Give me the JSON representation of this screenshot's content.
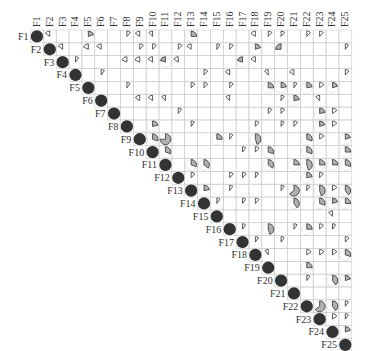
{
  "chart_data": {
    "type": "heatmap",
    "subtype": "correlogram-pie-upper",
    "title": "",
    "variables": [
      "F1",
      "F2",
      "F3",
      "F4",
      "F5",
      "F6",
      "F7",
      "F8",
      "F9",
      "F10",
      "F11",
      "F12",
      "F13",
      "F14",
      "F15",
      "F16",
      "F17",
      "F18",
      "F19",
      "F20",
      "F21",
      "F22",
      "F23",
      "F24",
      "F25"
    ],
    "diagonal": "full dark circle (r=1)",
    "colors": {
      "diag": "#333333",
      "positive": "#b0b0b0",
      "negative": "#b0b0b0",
      "outline": "#333333",
      "grid": "#cccccc"
    },
    "cells": [
      {
        "r": 1,
        "c": 2,
        "v": -0.15
      },
      {
        "r": 1,
        "c": 5,
        "v": 0.2
      },
      {
        "r": 1,
        "c": 8,
        "v": 0.12
      },
      {
        "r": 1,
        "c": 9,
        "v": -0.15
      },
      {
        "r": 1,
        "c": 10,
        "v": -0.12
      },
      {
        "r": 1,
        "c": 13,
        "v": 0.25
      },
      {
        "r": 1,
        "c": 18,
        "v": -0.15
      },
      {
        "r": 1,
        "c": 19,
        "v": 0.12
      },
      {
        "r": 1,
        "c": 20,
        "v": 0.12
      },
      {
        "r": 1,
        "c": 22,
        "v": 0.12
      },
      {
        "r": 1,
        "c": 23,
        "v": 0.12
      },
      {
        "r": 2,
        "c": 3,
        "v": -0.15
      },
      {
        "r": 2,
        "c": 5,
        "v": -0.18
      },
      {
        "r": 2,
        "c": 6,
        "v": -0.15
      },
      {
        "r": 2,
        "c": 9,
        "v": 0.12
      },
      {
        "r": 2,
        "c": 10,
        "v": 0.12
      },
      {
        "r": 2,
        "c": 12,
        "v": 0.12
      },
      {
        "r": 2,
        "c": 13,
        "v": -0.15
      },
      {
        "r": 2,
        "c": 15,
        "v": 0.1
      },
      {
        "r": 2,
        "c": 16,
        "v": 0.12
      },
      {
        "r": 2,
        "c": 18,
        "v": 0.2
      },
      {
        "r": 2,
        "c": 20,
        "v": -0.25
      },
      {
        "r": 2,
        "c": 25,
        "v": 0.1
      },
      {
        "r": 3,
        "c": 4,
        "v": 0.1
      },
      {
        "r": 3,
        "c": 8,
        "v": -0.18
      },
      {
        "r": 3,
        "c": 9,
        "v": -0.18
      },
      {
        "r": 3,
        "c": 10,
        "v": -0.15
      },
      {
        "r": 3,
        "c": 11,
        "v": -0.2
      },
      {
        "r": 3,
        "c": 12,
        "v": -0.15
      },
      {
        "r": 3,
        "c": 17,
        "v": -0.2
      },
      {
        "r": 3,
        "c": 18,
        "v": -0.15
      },
      {
        "r": 4,
        "c": 6,
        "v": 0.1
      },
      {
        "r": 4,
        "c": 14,
        "v": 0.12
      },
      {
        "r": 4,
        "c": 16,
        "v": -0.15
      },
      {
        "r": 4,
        "c": 19,
        "v": -0.12
      },
      {
        "r": 4,
        "c": 21,
        "v": -0.15
      },
      {
        "r": 4,
        "c": 25,
        "v": 0.12
      },
      {
        "r": 5,
        "c": 8,
        "v": 0.1
      },
      {
        "r": 5,
        "c": 13,
        "v": 0.12
      },
      {
        "r": 5,
        "c": 14,
        "v": 0.12
      },
      {
        "r": 5,
        "c": 16,
        "v": 0.12
      },
      {
        "r": 5,
        "c": 19,
        "v": 0.25
      },
      {
        "r": 5,
        "c": 20,
        "v": 0.22
      },
      {
        "r": 5,
        "c": 21,
        "v": 0.1
      },
      {
        "r": 5,
        "c": 22,
        "v": 0.22
      },
      {
        "r": 5,
        "c": 23,
        "v": 0.15
      },
      {
        "r": 5,
        "c": 24,
        "v": 0.2
      },
      {
        "r": 6,
        "c": 9,
        "v": -0.15
      },
      {
        "r": 6,
        "c": 10,
        "v": -0.15
      },
      {
        "r": 6,
        "c": 11,
        "v": -0.12
      },
      {
        "r": 6,
        "c": 16,
        "v": -0.12
      },
      {
        "r": 6,
        "c": 20,
        "v": 0.1
      },
      {
        "r": 6,
        "c": 21,
        "v": 0.22
      },
      {
        "r": 6,
        "c": 23,
        "v": -0.12
      },
      {
        "r": 7,
        "c": 12,
        "v": 0.1
      },
      {
        "r": 7,
        "c": 19,
        "v": 0.12
      },
      {
        "r": 7,
        "c": 20,
        "v": 0.12
      },
      {
        "r": 7,
        "c": 23,
        "v": 0.22
      },
      {
        "r": 7,
        "c": 24,
        "v": 0.15
      },
      {
        "r": 8,
        "c": 10,
        "v": 0.22
      },
      {
        "r": 8,
        "c": 13,
        "v": 0.1
      },
      {
        "r": 8,
        "c": 18,
        "v": 0.12
      },
      {
        "r": 8,
        "c": 20,
        "v": 0.1
      },
      {
        "r": 8,
        "c": 21,
        "v": 0.12
      },
      {
        "r": 8,
        "c": 23,
        "v": 0.2
      },
      {
        "r": 8,
        "c": 24,
        "v": 0.15
      },
      {
        "r": 9,
        "c": 10,
        "v": 0.3
      },
      {
        "r": 9,
        "c": 11,
        "v": 0.75
      },
      {
        "r": 9,
        "c": 15,
        "v": 0.25
      },
      {
        "r": 9,
        "c": 16,
        "v": 0.1
      },
      {
        "r": 9,
        "c": 18,
        "v": 0.45
      },
      {
        "r": 9,
        "c": 22,
        "v": 0.3
      },
      {
        "r": 9,
        "c": 23,
        "v": 0.15
      },
      {
        "r": 9,
        "c": 25,
        "v": 0.2
      },
      {
        "r": 10,
        "c": 11,
        "v": 0.3
      },
      {
        "r": 10,
        "c": 17,
        "v": 0.1
      },
      {
        "r": 10,
        "c": 18,
        "v": 0.12
      },
      {
        "r": 10,
        "c": 19,
        "v": 0.3
      },
      {
        "r": 10,
        "c": 22,
        "v": 0.3
      },
      {
        "r": 10,
        "c": 25,
        "v": 0.25
      },
      {
        "r": 11,
        "c": 13,
        "v": 0.3
      },
      {
        "r": 11,
        "c": 14,
        "v": 0.35
      },
      {
        "r": 11,
        "c": 19,
        "v": 0.35
      },
      {
        "r": 11,
        "c": 21,
        "v": 0.25
      },
      {
        "r": 11,
        "c": 22,
        "v": 0.45
      },
      {
        "r": 11,
        "c": 23,
        "v": 0.25
      },
      {
        "r": 11,
        "c": 24,
        "v": 0.25
      },
      {
        "r": 11,
        "c": 25,
        "v": 0.3
      },
      {
        "r": 12,
        "c": 13,
        "v": 0.12
      },
      {
        "r": 12,
        "c": 16,
        "v": 0.12
      },
      {
        "r": 12,
        "c": 17,
        "v": 0.12
      },
      {
        "r": 12,
        "c": 18,
        "v": 0.1
      },
      {
        "r": 12,
        "c": 22,
        "v": 0.22
      },
      {
        "r": 12,
        "c": 23,
        "v": 0.12
      },
      {
        "r": 13,
        "c": 14,
        "v": 0.22
      },
      {
        "r": 13,
        "c": 16,
        "v": 0.1
      },
      {
        "r": 13,
        "c": 20,
        "v": 0.1
      },
      {
        "r": 13,
        "c": 21,
        "v": 0.65
      },
      {
        "r": 13,
        "c": 22,
        "v": 0.1
      },
      {
        "r": 13,
        "c": 23,
        "v": 0.45
      },
      {
        "r": 13,
        "c": 24,
        "v": 0.15
      },
      {
        "r": 13,
        "c": 25,
        "v": 0.4
      },
      {
        "r": 13,
        "c": 26,
        "v": 0.1
      },
      {
        "r": 14,
        "c": 15,
        "v": 0.1
      },
      {
        "r": 14,
        "c": 17,
        "v": 0.1
      },
      {
        "r": 14,
        "c": 18,
        "v": 0.12
      },
      {
        "r": 14,
        "c": 21,
        "v": 0.4
      },
      {
        "r": 14,
        "c": 23,
        "v": 0.3
      },
      {
        "r": 14,
        "c": 24,
        "v": 0.2
      },
      {
        "r": 14,
        "c": 25,
        "v": 0.25
      },
      {
        "r": 14,
        "c": 26,
        "v": 0.45
      },
      {
        "r": 15,
        "c": 24,
        "v": -0.12
      },
      {
        "r": 16,
        "c": 17,
        "v": 0.1
      },
      {
        "r": 16,
        "c": 19,
        "v": 0.45
      },
      {
        "r": 16,
        "c": 21,
        "v": 0.1
      },
      {
        "r": 16,
        "c": 22,
        "v": 0.25
      },
      {
        "r": 16,
        "c": 23,
        "v": 0.12
      },
      {
        "r": 16,
        "c": 24,
        "v": 0.1
      },
      {
        "r": 17,
        "c": 18,
        "v": 0.1
      },
      {
        "r": 17,
        "c": 20,
        "v": 0.1
      },
      {
        "r": 17,
        "c": 25,
        "v": 0.12
      },
      {
        "r": 18,
        "c": 19,
        "v": -0.1
      },
      {
        "r": 18,
        "c": 22,
        "v": 0.15
      },
      {
        "r": 18,
        "c": 23,
        "v": 0.15
      },
      {
        "r": 18,
        "c": 24,
        "v": 0.15
      },
      {
        "r": 18,
        "c": 25,
        "v": 0.3
      },
      {
        "r": 19,
        "c": 22,
        "v": 0.25
      },
      {
        "r": 20,
        "c": 22,
        "v": 0.1
      },
      {
        "r": 20,
        "c": 24,
        "v": 0.4
      },
      {
        "r": 20,
        "c": 25,
        "v": 0.2
      },
      {
        "r": 22,
        "c": 23,
        "v": 0.65
      },
      {
        "r": 22,
        "c": 24,
        "v": 0.4
      },
      {
        "r": 22,
        "c": 25,
        "v": 0.1
      },
      {
        "r": 23,
        "c": 24,
        "v": 0.15
      },
      {
        "r": 23,
        "c": 25,
        "v": 0.1
      },
      {
        "r": 24,
        "c": 25,
        "v": 0.2
      }
    ],
    "legend": "none",
    "grid": true
  }
}
